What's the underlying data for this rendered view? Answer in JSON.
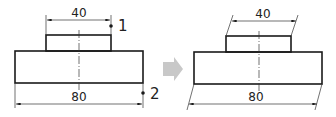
{
  "diagram": {
    "colors": {
      "line": "#1a1a1a",
      "thin": "#333333",
      "arrow": "#c8c8c8"
    },
    "left": {
      "dim_top_label": "40",
      "dim_bottom_label": "80",
      "point_1_label": "1",
      "point_2_label": "2"
    },
    "transition_arrow": "right-arrow",
    "right": {
      "dim_top_label": "40",
      "dim_bottom_label": "80"
    }
  }
}
